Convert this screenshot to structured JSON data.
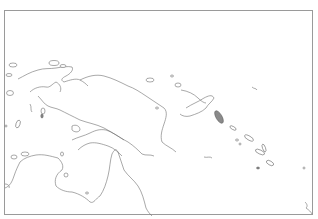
{
  "map": {
    "title_clipped": "",
    "frame": {
      "x": 4,
      "y": 10,
      "width": 309,
      "height": 205,
      "border_color": "#9a9a9a"
    },
    "style": {
      "background": "#ffffff",
      "coastline_color": "#6f6f6f",
      "type": "blank outline map"
    },
    "regions": [
      {
        "name": "new-guinea",
        "kind": "mainland-coast"
      },
      {
        "name": "bismarck-archipelago",
        "kind": "island-group"
      },
      {
        "name": "solomon-islands",
        "kind": "island-group"
      },
      {
        "name": "northern-australia",
        "kind": "mainland-coast"
      }
    ]
  }
}
